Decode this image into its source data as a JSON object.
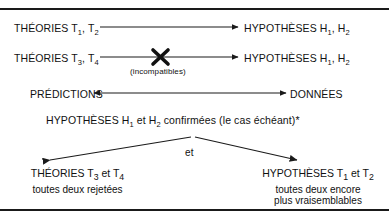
{
  "figure": {
    "rule_color": "#1a1a1a",
    "text_color": "#111111",
    "background": "#ffffff"
  },
  "rows": [
    {
      "left": "THÉORIES T",
      "left_sub1": "1",
      "left_mid": ", T",
      "left_sub2": "2",
      "right": "HYPOTHÈSES H",
      "right_sub1": "1",
      "right_mid": ", H",
      "right_sub2": "2",
      "arrow": "arrow-right",
      "crossed": false
    },
    {
      "left": "THÉORIES T",
      "left_sub1": "3",
      "left_mid": ", T",
      "left_sub2": "4",
      "right": "HYPOTHÈSES H",
      "right_sub1": "1",
      "right_mid": ", H",
      "right_sub2": "2",
      "arrow": "arrow-right-crossed",
      "crossed": true,
      "cross_label": "(incompatibles)"
    }
  ],
  "predictions_row": {
    "left": "PRÉDICTIONS",
    "right": "DONNÉES",
    "arrow": "arrow-double"
  },
  "confirmation": {
    "prefix": "HYPOTHÈSES H",
    "sub1": "1",
    "mid": " et H",
    "sub2": "2",
    "suffix": " confirmées (le cas échéant)*"
  },
  "branch": {
    "connector_label": "et",
    "left_branch": {
      "head": "THÉORIES T",
      "head_sub1": "3",
      "head_mid": " et T",
      "head_sub2": "4",
      "lines": [
        "toutes deux rejetées"
      ]
    },
    "right_branch": {
      "head": "HYPOTHÈSES T",
      "head_sub1": "1",
      "head_mid": " et T",
      "head_sub2": "2",
      "lines": [
        "toutes deux encore",
        "plus vraisemblables"
      ]
    }
  }
}
